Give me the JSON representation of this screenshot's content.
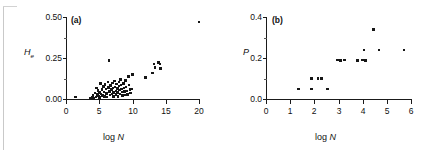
{
  "figure": {
    "background": "#ffffff",
    "point_color": "#161616",
    "axis_color": "#1a1a1a"
  },
  "chart_data": [
    {
      "type": "scatter",
      "panel_label": "(a)",
      "title": "",
      "xlabel": "log N",
      "ylabel": "He",
      "ylabel_base": "H",
      "ylabel_sub": "e",
      "xlim": [
        0,
        20
      ],
      "ylim": [
        0.0,
        0.5
      ],
      "xticks": [
        0,
        5,
        10,
        15,
        20
      ],
      "xticklabels": [
        "0",
        "5",
        "10",
        "15",
        "20"
      ],
      "yticks": [
        0.0,
        0.25,
        0.5
      ],
      "yticklabels": [
        "0.00",
        "0.25",
        "0.50"
      ],
      "yminorticks": [
        0.125,
        0.375
      ],
      "grid": false,
      "legend": false,
      "points": [
        [
          1.4,
          0.012
        ],
        [
          3.6,
          0.008
        ],
        [
          3.9,
          0.01
        ],
        [
          4.1,
          0.022
        ],
        [
          4.2,
          0.006
        ],
        [
          4.4,
          0.035
        ],
        [
          4.5,
          0.014
        ],
        [
          4.6,
          0.068
        ],
        [
          4.7,
          0.026
        ],
        [
          4.8,
          0.052
        ],
        [
          4.9,
          0.018
        ],
        [
          5.0,
          0.04
        ],
        [
          5.05,
          0.01
        ],
        [
          5.2,
          0.095
        ],
        [
          5.3,
          0.03
        ],
        [
          5.4,
          0.058
        ],
        [
          5.5,
          0.02
        ],
        [
          5.6,
          0.075
        ],
        [
          5.7,
          0.044
        ],
        [
          5.8,
          0.016
        ],
        [
          5.9,
          0.088
        ],
        [
          6.0,
          0.062
        ],
        [
          6.1,
          0.034
        ],
        [
          6.15,
          0.012
        ],
        [
          6.3,
          0.105
        ],
        [
          6.4,
          0.07
        ],
        [
          6.5,
          0.235
        ],
        [
          6.55,
          0.048
        ],
        [
          6.6,
          0.024
        ],
        [
          6.7,
          0.082
        ],
        [
          6.8,
          0.056
        ],
        [
          6.9,
          0.03
        ],
        [
          7.0,
          0.098
        ],
        [
          7.1,
          0.066
        ],
        [
          7.15,
          0.04
        ],
        [
          7.2,
          0.018
        ],
        [
          7.3,
          0.11
        ],
        [
          7.4,
          0.074
        ],
        [
          7.5,
          0.05
        ],
        [
          7.55,
          0.028
        ],
        [
          7.6,
          0.09
        ],
        [
          7.7,
          0.064
        ],
        [
          7.8,
          0.038
        ],
        [
          7.85,
          0.016
        ],
        [
          7.95,
          0.102
        ],
        [
          8.0,
          0.078
        ],
        [
          8.05,
          0.054
        ],
        [
          8.1,
          0.032
        ],
        [
          8.2,
          0.12
        ],
        [
          8.3,
          0.086
        ],
        [
          8.35,
          0.06
        ],
        [
          8.4,
          0.042
        ],
        [
          8.5,
          0.022
        ],
        [
          8.6,
          0.094
        ],
        [
          8.7,
          0.068
        ],
        [
          8.75,
          0.046
        ],
        [
          8.8,
          0.026
        ],
        [
          8.9,
          0.112
        ],
        [
          9.0,
          0.072
        ],
        [
          9.1,
          0.05
        ],
        [
          9.2,
          0.03
        ],
        [
          9.4,
          0.14
        ],
        [
          9.5,
          0.084
        ],
        [
          9.6,
          0.058
        ],
        [
          9.7,
          0.036
        ],
        [
          9.9,
          0.062
        ],
        [
          10.0,
          0.15
        ],
        [
          11.9,
          0.132
        ],
        [
          13.0,
          0.16
        ],
        [
          13.2,
          0.215
        ],
        [
          13.4,
          0.192
        ],
        [
          13.9,
          0.222
        ],
        [
          14.1,
          0.215
        ],
        [
          14.2,
          0.186
        ],
        [
          20.0,
          0.47
        ]
      ]
    },
    {
      "type": "scatter",
      "panel_label": "(b)",
      "title": "",
      "xlabel": "log N",
      "ylabel": "P",
      "xlim": [
        0,
        6
      ],
      "ylim": [
        0.0,
        0.4
      ],
      "xticks": [
        0,
        1,
        2,
        3,
        4,
        5,
        6
      ],
      "xticklabels": [
        "0",
        "1",
        "2",
        "3",
        "4",
        "5",
        "6"
      ],
      "yticks": [
        0.0,
        0.2,
        0.4
      ],
      "yticklabels": [
        "0.0",
        "0.2",
        "0.4"
      ],
      "yminorticks": [
        0.1,
        0.3
      ],
      "grid": false,
      "legend": false,
      "points": [
        [
          1.35,
          0.05
        ],
        [
          1.88,
          0.1
        ],
        [
          1.88,
          0.05
        ],
        [
          2.15,
          0.1
        ],
        [
          2.3,
          0.1
        ],
        [
          2.55,
          0.05
        ],
        [
          2.95,
          0.19
        ],
        [
          3.03,
          0.19
        ],
        [
          3.1,
          0.19
        ],
        [
          3.25,
          0.19
        ],
        [
          3.8,
          0.19
        ],
        [
          4.0,
          0.19
        ],
        [
          4.12,
          0.19
        ],
        [
          4.05,
          0.24
        ],
        [
          4.45,
          0.34
        ],
        [
          4.68,
          0.24
        ],
        [
          5.7,
          0.238
        ]
      ]
    }
  ]
}
